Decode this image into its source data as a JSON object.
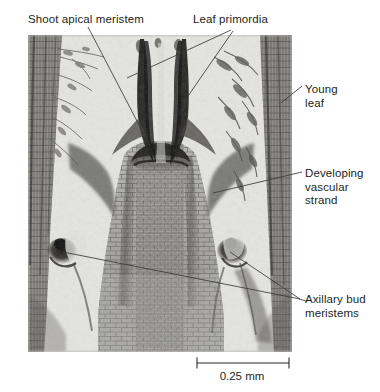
{
  "figure": {
    "type": "labeled-micrograph",
    "background_color": "#ffffff",
    "text_color": "#231f20"
  },
  "labels": {
    "shoot_apical_meristem": "Shoot apical meristem",
    "leaf_primordia": "Leaf primordia",
    "young_leaf": "Young\nleaf",
    "developing_vascular_strand": "Developing\nvascular\nstrand",
    "axillary_bud_meristems": "Axillary bud\nmeristems"
  },
  "scale_bar": {
    "caption": "0.25 mm",
    "length_px": 92,
    "value": 0.25,
    "unit": "mm"
  },
  "micrograph": {
    "left": 28,
    "top": 35,
    "width": 264,
    "height": 317,
    "palette": {
      "pale_background": "#e4e4e1",
      "tissue_mid": "#9b9b96",
      "tissue_dark": "#4a4845",
      "very_dark": "#1d1b1a",
      "cell_outline": "#6f6e69"
    },
    "features": [
      {
        "name": "apical-dome",
        "cx": 150,
        "cy": 150
      },
      {
        "name": "leaf-primordium-left",
        "cx": 122,
        "cy": 95
      },
      {
        "name": "leaf-primordium-right",
        "cx": 178,
        "cy": 95
      },
      {
        "name": "axillary-bud-left",
        "cx": 62,
        "cy": 250
      },
      {
        "name": "axillary-bud-right",
        "cx": 228,
        "cy": 250
      },
      {
        "name": "vascular-strand",
        "cx": 210,
        "cy": 195
      }
    ]
  },
  "leaders": {
    "shoot_apical_meristem": [
      [
        88,
        27
      ],
      [
        150,
        146
      ]
    ],
    "leaf_primordia_a": [
      [
        231,
        30
      ],
      [
        127,
        78
      ]
    ],
    "leaf_primordia_b": [
      [
        233,
        31
      ],
      [
        188,
        96
      ]
    ],
    "young_leaf": [
      [
        302,
        86
      ],
      [
        281,
        103
      ]
    ],
    "developing_vascular_strand": [
      [
        302,
        172
      ],
      [
        213,
        193
      ]
    ],
    "axillary_bud_left": [
      [
        300,
        299
      ],
      [
        63,
        252
      ]
    ],
    "axillary_bud_right": [
      [
        300,
        299
      ],
      [
        230,
        252
      ]
    ],
    "axillary_bud_stub": [
      [
        300,
        299
      ],
      [
        307,
        301
      ]
    ]
  }
}
